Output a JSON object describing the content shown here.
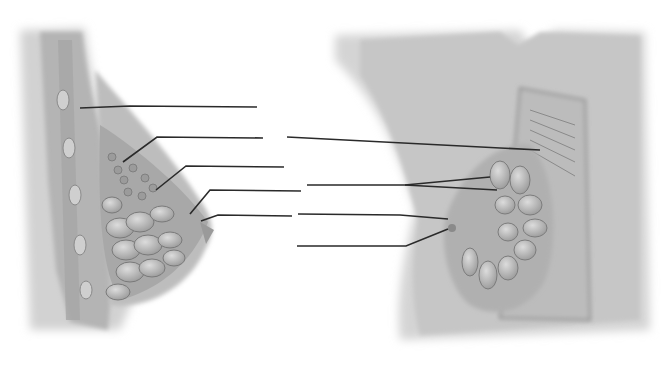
{
  "diagram": {
    "title": "",
    "left_view": {
      "name": "sagittal-section-breast"
    },
    "right_view": {
      "name": "anterior-dissection-breast"
    },
    "labels": [
      {
        "id": "L1",
        "text": "",
        "leader": [
          [
            80,
            108
          ],
          [
            130,
            106
          ],
          [
            257,
            107
          ]
        ]
      },
      {
        "id": "L2",
        "text": "",
        "leader": [
          [
            123,
            162
          ],
          [
            157,
            137
          ],
          [
            263,
            138
          ]
        ]
      },
      {
        "id": "L3",
        "text": "",
        "leader": [
          [
            156,
            190
          ],
          [
            186,
            166
          ],
          [
            284,
            167
          ]
        ]
      },
      {
        "id": "L4",
        "text": "",
        "leader": [
          [
            190,
            214
          ],
          [
            210,
            190
          ],
          [
            301,
            191
          ]
        ]
      },
      {
        "id": "L5",
        "text": "",
        "leader": [
          [
            201,
            221
          ],
          [
            218,
            215
          ],
          [
            292,
            216
          ]
        ]
      },
      {
        "id": "R1",
        "text": "",
        "leader": [
          [
            287,
            137
          ],
          [
            540,
            150
          ]
        ]
      },
      {
        "id": "R2",
        "text": "",
        "leader": [
          [
            307,
            185
          ],
          [
            405,
            185
          ],
          [
            490,
            177
          ]
        ],
        "branch": [
          [
            405,
            185
          ],
          [
            497,
            190
          ]
        ]
      },
      {
        "id": "R3",
        "text": "",
        "leader": [
          [
            298,
            214
          ],
          [
            400,
            215
          ],
          [
            448,
            219
          ]
        ]
      },
      {
        "id": "R4",
        "text": "",
        "leader": [
          [
            297,
            246
          ],
          [
            406,
            246
          ],
          [
            448,
            229
          ]
        ]
      }
    ]
  },
  "colors": {
    "background": "#ffffff",
    "tissue": "#b9b9b9",
    "line": "#2a2a2a"
  }
}
